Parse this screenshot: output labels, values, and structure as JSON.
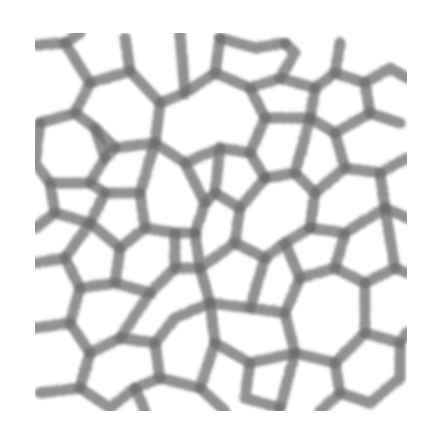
{
  "image": {
    "description": "Grayscale cellular foam / Voronoi-like network texture",
    "background_color": "#ffffff",
    "stroke_color": "#6e6e6e",
    "bounds": {
      "x": 35,
      "y": 33,
      "width": 372,
      "height": 378
    }
  }
}
